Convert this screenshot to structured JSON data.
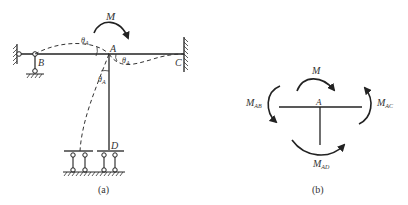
{
  "figure_a": {
    "caption": "(a)",
    "moment_label": "M",
    "joint_labels": {
      "A": "A",
      "B": "B",
      "C": "C",
      "D": "D"
    },
    "rotation_label": "θ",
    "rotation_sub": "A"
  },
  "figure_b": {
    "caption": "(b)",
    "joint_label": "A",
    "moment_label": "M",
    "moments": [
      {
        "name": "M",
        "sub": "AB"
      },
      {
        "name": "M",
        "sub": "AC"
      },
      {
        "name": "M",
        "sub": "AD"
      }
    ]
  },
  "colors": {
    "line": "#222222",
    "text": "#333333",
    "background": "#ffffff"
  }
}
